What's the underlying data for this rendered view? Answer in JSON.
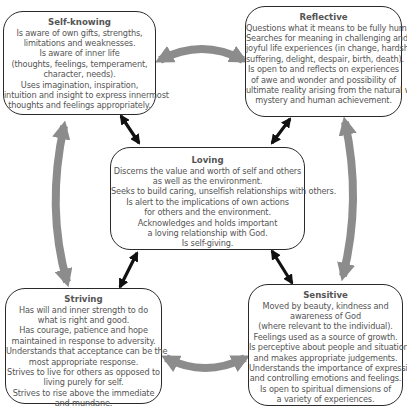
{
  "diagram": {
    "type": "hub-and-spoke concept diagram",
    "colors": {
      "box_border": "#2a2a2a",
      "box_fill": "#ffffff",
      "title_text": "#111111",
      "body_text": "#555555",
      "curved_arrow": "#8c8c8c",
      "straight_arrow": "#111111"
    },
    "boxes": {
      "self_knowing": {
        "title": "Self-knowing",
        "lines": [
          "Is aware of own gifts, strengths,",
          "limitations and weaknesses.",
          "Is aware of inner life",
          "(thoughts, feelings, temperament,",
          "character, needs).",
          "Uses imagination, inspiration,",
          "intuition and insight to express innermost",
          "thoughts and feelings appropriately."
        ]
      },
      "reflective": {
        "title": "Reflective",
        "lines": [
          "Questions what it means to be fully human.",
          "Searches for meaning in challenging and",
          "joyful life experiences (in change, hardship,",
          "suffering, delight, despair, birth, death).",
          "Is open to and reflects on experiences",
          "of awe and wonder and possibility of",
          "ultimate reality arising from the natural world,",
          "mystery and human achievement."
        ]
      },
      "loving": {
        "title": "Loving",
        "lines": [
          "Discerns the value and worth of self and others",
          "as well as the environment.",
          "Seeks to build caring, unselfish relationships with others.",
          "Is alert to the implications of own actions",
          "for others and the environment.",
          "Acknowledges and holds important",
          "a loving relationship with God.",
          "Is self-giving."
        ]
      },
      "striving": {
        "title": "Striving",
        "lines": [
          "Has will and inner strength to do",
          "what is right and good.",
          "Has courage, patience and hope",
          "maintained in response to adversity.",
          "Understands that acceptance can be the",
          "most appropriate response.",
          "Strives to live for others as opposed to",
          "living purely for self.",
          "Strives to rise above the immediate",
          "and mundane."
        ]
      },
      "sensitive": {
        "title": "Sensitive",
        "lines": [
          "Moved by beauty, kindness and",
          "awareness of God",
          "(where relevant to the individual).",
          "Feelings used as a source of growth.",
          "Is perceptive about people and situations",
          "and makes appropriate judgements.",
          "Understands the importance of expressing",
          "and controlling emotions and feelings.",
          "Is open to spiritual dimensions of",
          "a variety of experiences."
        ]
      }
    },
    "connections": [
      {
        "from": "Self-knowing",
        "to": "Reflective",
        "style": "curved gray double arrow"
      },
      {
        "from": "Reflective",
        "to": "Sensitive",
        "style": "curved gray double arrow"
      },
      {
        "from": "Sensitive",
        "to": "Striving",
        "style": "curved gray double arrow"
      },
      {
        "from": "Striving",
        "to": "Self-knowing",
        "style": "curved gray double arrow"
      },
      {
        "from": "Loving",
        "to": "Self-knowing",
        "style": "straight black double arrow"
      },
      {
        "from": "Loving",
        "to": "Reflective",
        "style": "straight black double arrow"
      },
      {
        "from": "Loving",
        "to": "Striving",
        "style": "straight black double arrow"
      },
      {
        "from": "Loving",
        "to": "Sensitive",
        "style": "straight black double arrow"
      }
    ]
  }
}
